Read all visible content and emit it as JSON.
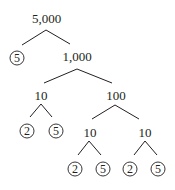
{
  "diagram": {
    "type": "factor-tree",
    "root": "5,000",
    "colors": {
      "ink": "#231f20",
      "background": "#ffffff"
    },
    "nodes": {
      "n_5000": {
        "label": "5,000",
        "prime": false
      },
      "n_5a": {
        "label": "5",
        "prime": true
      },
      "n_1000": {
        "label": "1,000",
        "prime": false
      },
      "n_10a": {
        "label": "10",
        "prime": false
      },
      "n_100": {
        "label": "100",
        "prime": false
      },
      "n_2a": {
        "label": "2",
        "prime": true
      },
      "n_5b": {
        "label": "5",
        "prime": true
      },
      "n_10b": {
        "label": "10",
        "prime": false
      },
      "n_10c": {
        "label": "10",
        "prime": false
      },
      "n_2b": {
        "label": "2",
        "prime": true
      },
      "n_5c": {
        "label": "5",
        "prime": true
      },
      "n_2c": {
        "label": "2",
        "prime": true
      },
      "n_5d": {
        "label": "5",
        "prime": true
      }
    },
    "edges": [
      [
        "5,000",
        "5"
      ],
      [
        "5,000",
        "1,000"
      ],
      [
        "1,000",
        "10"
      ],
      [
        "1,000",
        "100"
      ],
      [
        "10",
        "2"
      ],
      [
        "10",
        "5"
      ],
      [
        "100",
        "10"
      ],
      [
        "100",
        "10"
      ],
      [
        "10",
        "2"
      ],
      [
        "10",
        "5"
      ],
      [
        "10",
        "2"
      ],
      [
        "10",
        "5"
      ]
    ]
  }
}
